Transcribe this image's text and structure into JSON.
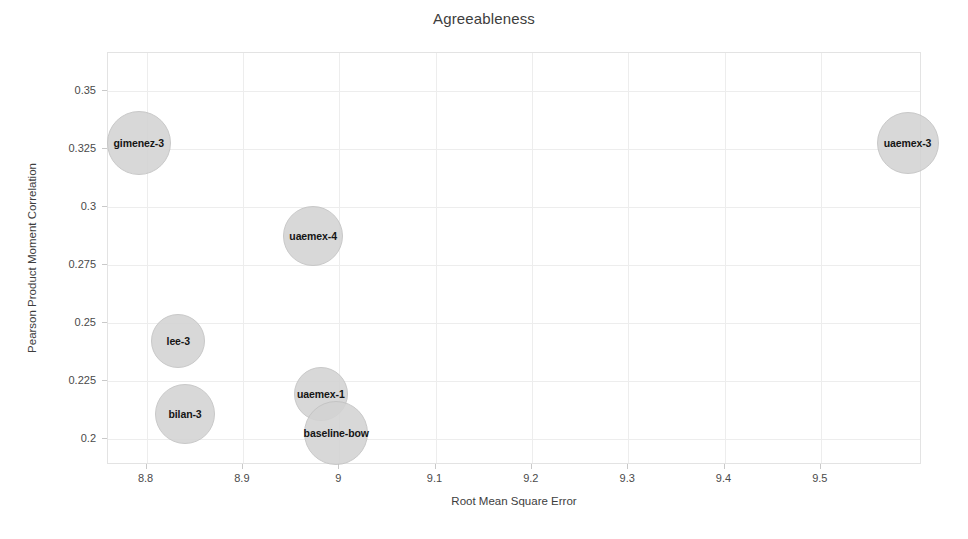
{
  "chart_data": {
    "type": "scatter",
    "variant": "bubble",
    "title": "Agreeableness",
    "xlabel": "Root Mean Square Error",
    "ylabel": "Pearson Product Moment Correlation",
    "xlim": [
      8.76,
      9.605
    ],
    "ylim": [
      0.189,
      0.3665
    ],
    "xticks": [
      8.8,
      8.9,
      9.0,
      9.1,
      9.2,
      9.3,
      9.4,
      9.5
    ],
    "xtick_labels": [
      "8.8",
      "8.9",
      "9",
      "9.1",
      "9.2",
      "9.3",
      "9.4",
      "9.5"
    ],
    "yticks": [
      0.35,
      0.325,
      0.3,
      0.275,
      0.25,
      0.225,
      0.2
    ],
    "ytick_labels": [
      "0.35",
      "0.325",
      "0.3",
      "0.275",
      "0.25",
      "0.225",
      "0.2"
    ],
    "grid": true,
    "legend": "none",
    "bubble_color": "#d3d3d3",
    "bubble_edge_color": "#c2c2c2",
    "points": [
      {
        "label": "gimenez-3",
        "x": 8.793,
        "y": 0.3275,
        "size": 32
      },
      {
        "label": "uaemex-3",
        "x": 9.591,
        "y": 0.3275,
        "size": 31
      },
      {
        "label": "uaemex-4",
        "x": 8.974,
        "y": 0.2872,
        "size": 30
      },
      {
        "label": "lee-3",
        "x": 8.834,
        "y": 0.2418,
        "size": 27
      },
      {
        "label": "bilan-3",
        "x": 8.841,
        "y": 0.2106,
        "size": 30
      },
      {
        "label": "uaemex-1",
        "x": 8.982,
        "y": 0.2193,
        "size": 27
      },
      {
        "label": "baseline-bow",
        "x": 8.998,
        "y": 0.2023,
        "size": 32
      }
    ]
  }
}
